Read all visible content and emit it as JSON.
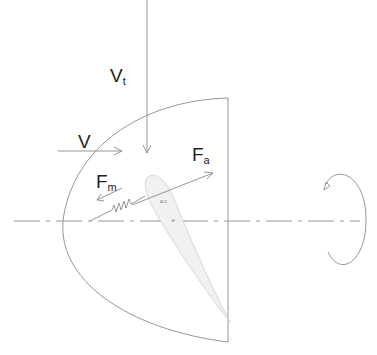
{
  "diagram": {
    "labels": {
      "v_t": {
        "main": "V",
        "sub": "t"
      },
      "v": {
        "main": "V",
        "sub": ""
      },
      "f_a": {
        "main": "F",
        "sub": "a"
      },
      "f_m": {
        "main": "F",
        "sub": "m"
      },
      "point_ac": "a.c",
      "point_e": "e"
    },
    "colors": {
      "stroke": "#8a8a8a",
      "airfoil_fill": "#f1f1f1",
      "airfoil_stroke": "#cfcfcf",
      "text": "#222222"
    }
  }
}
